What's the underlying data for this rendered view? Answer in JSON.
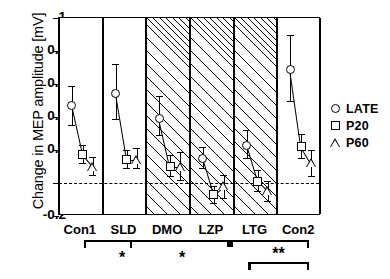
{
  "chart_data": {
    "type": "scatter",
    "title": "",
    "xlabel": "",
    "ylabel": "Change in MEP amplitude [mV]",
    "ylim": [
      -0.2,
      1
    ],
    "yticks": [
      "1",
      "0.8",
      "0.6",
      "0.4",
      "0.2",
      "0",
      "-0.2"
    ],
    "ytick_values": [
      1,
      0.8,
      0.6,
      0.4,
      0.2,
      0,
      -0.2
    ],
    "grid": false,
    "zero_reference_line": 0,
    "legend_position": "right",
    "categories": [
      "Con1",
      "SLD",
      "DMO",
      "LZP",
      "LTG",
      "Con2"
    ],
    "shaded_categories": [
      "DMO",
      "LZP",
      "LTG"
    ],
    "series": [
      {
        "name": "LATE",
        "marker": "circle",
        "values": [
          0.47,
          0.54,
          0.39,
          0.15,
          0.23,
          0.69
        ],
        "err_low": [
          0.35,
          0.39,
          0.29,
          0.09,
          0.15,
          0.5
        ],
        "err_high": [
          0.59,
          0.72,
          0.53,
          0.22,
          0.32,
          0.9
        ]
      },
      {
        "name": "P20",
        "marker": "square",
        "values": [
          0.17,
          0.14,
          0.1,
          -0.07,
          0.01,
          0.22
        ],
        "err_low": [
          0.12,
          0.09,
          0.04,
          -0.12,
          -0.05,
          0.15
        ],
        "err_high": [
          0.23,
          0.2,
          0.17,
          -0.02,
          0.08,
          0.3
        ]
      },
      {
        "name": "P60",
        "marker": "triangle",
        "values": [
          0.1,
          0.14,
          0.1,
          -0.02,
          -0.05,
          0.12
        ],
        "err_low": [
          0.05,
          0.09,
          0.02,
          -0.09,
          -0.11,
          0.04
        ],
        "err_high": [
          0.16,
          0.21,
          0.19,
          0.05,
          0.01,
          0.2
        ]
      }
    ],
    "annotations": [
      {
        "text": "*",
        "near": "Con1-SLD"
      },
      {
        "text": "*",
        "near": "DMO"
      },
      {
        "text": "**",
        "near": "LTG-Con2"
      }
    ]
  },
  "legend": {
    "items": [
      {
        "symbol": "circle",
        "label": "LATE"
      },
      {
        "symbol": "square",
        "label": "P20"
      },
      {
        "symbol": "triangle",
        "label": "P60"
      }
    ]
  },
  "axis": {
    "y_title": "Change in MEP amplitude [mV]",
    "y_labels": [
      "1",
      "0.8",
      "0.6",
      "0.4",
      "0.2",
      "0",
      "-0.2"
    ],
    "x_labels": [
      "Con1",
      "SLD",
      "DMO",
      "LZP",
      "LTG",
      "Con2"
    ]
  },
  "significance": {
    "star_single_left": "*",
    "star_single_mid": "*",
    "star_double": "**"
  },
  "colors": {
    "ink": "#000000",
    "background": "#ffffff",
    "hatch": "#000000"
  }
}
